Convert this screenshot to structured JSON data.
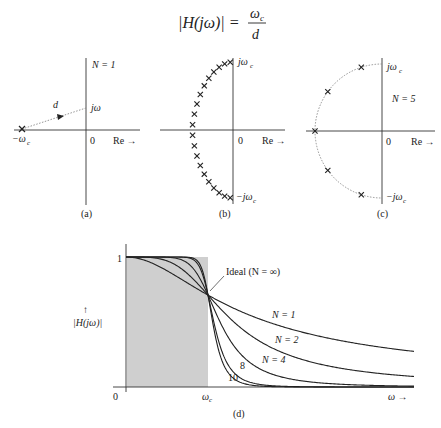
{
  "equation": {
    "lhs": "|H(jω)| =",
    "numerator": "ω",
    "numerator_sub": "c",
    "denominator": "d"
  },
  "panel_a": {
    "caption": "(a)",
    "order_label": "N = 1",
    "pole_label": "−ω",
    "pole_label_sub": "c",
    "point_label": "jω",
    "distance_label": "d",
    "origin_label": "0",
    "real_axis_label": "Re →"
  },
  "panel_b": {
    "caption": "(b)",
    "top_label": "jω",
    "top_label_sub": "c",
    "bottom_label": "−jω",
    "bottom_label_sub": "c",
    "origin_label": "0",
    "real_axis_label": "Re →",
    "pole_count": 20
  },
  "panel_c": {
    "caption": "(c)",
    "order_label": "N = 5",
    "top_label": "jω",
    "top_label_sub": "c",
    "bottom_label": "−jω",
    "bottom_label_sub": "c",
    "origin_label": "0",
    "real_axis_label": "Re →",
    "pole_count": 5
  },
  "panel_d": {
    "caption": "(d)",
    "y_tick_top": "1",
    "origin_label": "0",
    "cutoff_label": "ω",
    "cutoff_label_sub": "c",
    "x_axis_label": "ω →",
    "y_axis_arrow": "↑",
    "y_axis_label": "|H(jω)|",
    "ideal_label": "Ideal (N = ∞)",
    "curve_labels": [
      "N = 1",
      "N = 2",
      "N = 4",
      "8",
      "10"
    ]
  },
  "chart_data": {
    "type": "line",
    "xlabel": "ω",
    "ylabel": "|H(jω)|",
    "x_ticks": [
      "0",
      "ωc"
    ],
    "y_ticks": [
      "1"
    ],
    "ylim": [
      0,
      1
    ],
    "xlim_relative_to_wc": [
      0,
      2.8
    ],
    "series": [
      {
        "name": "N = 1",
        "formula": "1/sqrt(1+(ω/ωc)^2)"
      },
      {
        "name": "N = 2",
        "formula": "1/sqrt(1+(ω/ωc)^4)"
      },
      {
        "name": "N = 4",
        "formula": "1/sqrt(1+(ω/ωc)^8)"
      },
      {
        "name": "8",
        "formula": "1/sqrt(1+(ω/ωc)^16)"
      },
      {
        "name": "10",
        "formula": "1/sqrt(1+(ω/ωc)^20)"
      },
      {
        "name": "Ideal (N = ∞)",
        "formula": "1 for ω<ωc, 0 for ω>ωc (shaded region)"
      }
    ],
    "crossover_point": {
      "x": "ωc",
      "y": 0.707
    }
  },
  "colors": {
    "ink": "#222222",
    "shade": "#cfcfcf",
    "dotted": "#888888"
  }
}
